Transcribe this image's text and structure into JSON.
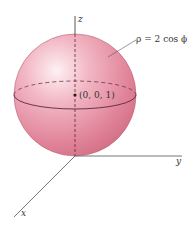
{
  "figure": {
    "type": "3d-sphere-diagram",
    "equation_label": "ρ = 2 cos ϕ",
    "center_label": "(0, 0, 1)",
    "axes": {
      "x": "x",
      "y": "y",
      "z": "z"
    },
    "colors": {
      "sphere_fill": "#e8899c",
      "sphere_highlight": "#fbe3e8",
      "sphere_edge": "#b05a6c",
      "axis": "#555555",
      "text": "#333333"
    }
  }
}
